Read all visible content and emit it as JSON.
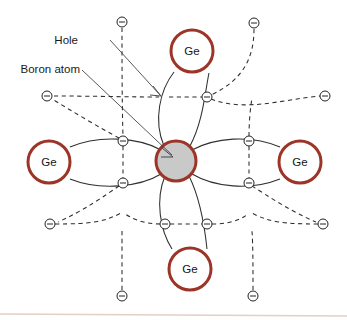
{
  "figure": {
    "background_color": "#ffffff",
    "baseline_color": "#e3cfc6"
  },
  "colors": {
    "atom_ring": "#9c3528",
    "boron_fill": "#c9c9c9",
    "bond_line": "#30302f",
    "dashed_line": "#2c2c2c",
    "electron_ring": "#232323",
    "text": "#1a1a1a"
  },
  "annotations": [
    {
      "id": "hole",
      "label": "Hole",
      "x": 78,
      "y": 40
    },
    {
      "id": "boron",
      "label": "Boron atom",
      "x": 16,
      "y": 69
    }
  ],
  "atoms": {
    "center": {
      "id": "boron-atom",
      "label": "",
      "element": "B",
      "x": 176,
      "y": 161,
      "r": 21,
      "kind": "boron",
      "fill": "#c9c9c9"
    },
    "neighbors": [
      {
        "id": "ge-top",
        "label": "Ge",
        "x": 192,
        "y": 51,
        "r": 21,
        "kind": "germanium"
      },
      {
        "id": "ge-right",
        "label": "Ge",
        "x": 300,
        "y": 162,
        "r": 21,
        "kind": "germanium"
      },
      {
        "id": "ge-bottom",
        "label": "Ge",
        "x": 190,
        "y": 269,
        "r": 21,
        "kind": "germanium"
      },
      {
        "id": "ge-left",
        "label": "Ge",
        "x": 49,
        "y": 162,
        "r": 21,
        "kind": "germanium"
      }
    ]
  },
  "electrons": {
    "symbol": "minus-in-circle",
    "radius": 5,
    "bond_electrons": [
      {
        "id": "e-top-right",
        "x": 207,
        "y": 97,
        "note": "top bond, right electron"
      },
      {
        "id": "e-left-upper",
        "x": 123,
        "y": 141,
        "note": "left bond, upper electron"
      },
      {
        "id": "e-left-lower",
        "x": 123,
        "y": 183,
        "note": "left bond, lower electron"
      },
      {
        "id": "e-right-upper",
        "x": 249,
        "y": 141,
        "note": "right bond, upper electron"
      },
      {
        "id": "e-right-lower",
        "x": 249,
        "y": 183,
        "note": "right bond, lower electron"
      },
      {
        "id": "e-bottom-left",
        "x": 165,
        "y": 224,
        "note": "bottom bond, left electron"
      },
      {
        "id": "e-bottom-right",
        "x": 207,
        "y": 224,
        "note": "bottom bond, right electron"
      }
    ],
    "hole_site": {
      "id": "hole-site",
      "x": 164,
      "y": 97,
      "note": "missing electron: the hole"
    },
    "outer_electrons": [
      {
        "id": "e-outer-top-left",
        "x": 122,
        "y": 22
      },
      {
        "id": "e-outer-top-right",
        "x": 254,
        "y": 23
      },
      {
        "id": "e-outer-left-upper",
        "x": 47,
        "y": 96
      },
      {
        "id": "e-outer-right-upper",
        "x": 325,
        "y": 96
      },
      {
        "id": "e-outer-left-lower",
        "x": 50,
        "y": 224
      },
      {
        "id": "e-outer-right-lower",
        "x": 323,
        "y": 224
      },
      {
        "id": "e-outer-bottom-left",
        "x": 122,
        "y": 296
      },
      {
        "id": "e-outer-bottom-right",
        "x": 253,
        "y": 296
      }
    ]
  },
  "bonds": {
    "description": "Each germanium neighbour shares a covalent pair with the central atom; one bond of the top pair is missing an electron, producing a hole.",
    "solid_pairs": 4,
    "dashed_arcs": 8
  }
}
